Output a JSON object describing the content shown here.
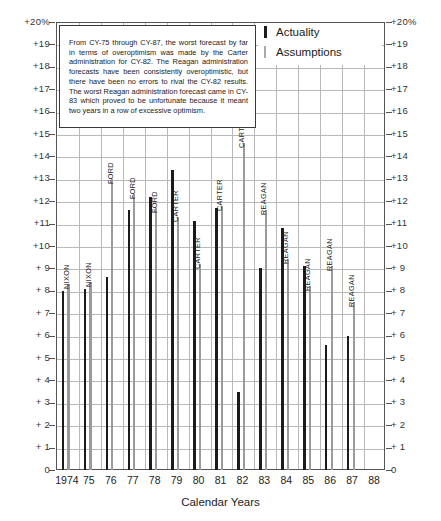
{
  "chart_data": {
    "type": "bar",
    "title": "",
    "xlabel": "Calendar Years",
    "ylabel": "",
    "ylim": [
      0,
      20
    ],
    "grid": true,
    "legend_position": "top-right",
    "categories": [
      "1974",
      "75",
      "76",
      "77",
      "78",
      "79",
      "80",
      "81",
      "82",
      "83",
      "84",
      "85",
      "86",
      "87",
      "88"
    ],
    "x_tick_labels": [
      "1974",
      "75",
      "76",
      "77",
      "78",
      "79",
      "80",
      "81",
      "82",
      "83",
      "84",
      "85",
      "86",
      "87",
      "88"
    ],
    "y_tick_labels": [
      "+20%",
      "+19",
      "+18",
      "+17",
      "+16",
      "+15",
      "+14",
      "+13",
      "+12",
      "+11",
      "+10",
      "+ 9",
      "+ 8",
      "+ 7",
      "+ 6",
      "+ 5",
      "+ 4",
      "+ 3",
      "+ 2",
      "+ 1",
      "0"
    ],
    "y_tick_values": [
      20,
      19,
      18,
      17,
      16,
      15,
      14,
      13,
      12,
      11,
      10,
      9,
      8,
      7,
      6,
      5,
      4,
      3,
      2,
      1,
      0
    ],
    "series": [
      {
        "name": "Actuality",
        "color": "#1b1b1b",
        "values": [
          8.0,
          8.1,
          8.6,
          11.6,
          12.2,
          13.4,
          11.1,
          11.7,
          3.5,
          9.0,
          10.8,
          9.1,
          5.6,
          6.0,
          null
        ]
      },
      {
        "name": "Assumptions",
        "color": "#9a9a9a",
        "values": [
          8.3,
          8.4,
          13.0,
          12.3,
          11.7,
          11.3,
          9.2,
          11.8,
          14.6,
          11.6,
          9.4,
          8.2,
          9.1,
          7.5,
          null
        ]
      }
    ],
    "bar_annotations": [
      {
        "year": "1974",
        "label": "NIXON",
        "series": "Assumptions"
      },
      {
        "year": "75",
        "label": "NIXON",
        "series": "Assumptions"
      },
      {
        "year": "76",
        "label": "FORD",
        "series": "Assumptions"
      },
      {
        "year": "77",
        "label": "FORD",
        "series": "Assumptions"
      },
      {
        "year": "78",
        "label": "FORD",
        "series": "Assumptions"
      },
      {
        "year": "79",
        "label": "CARTER",
        "series": "Assumptions"
      },
      {
        "year": "80",
        "label": "CARTER",
        "series": "Assumptions"
      },
      {
        "year": "81",
        "label": "CARTER",
        "series": "Assumptions"
      },
      {
        "year": "82",
        "label": "CARTER",
        "series": "Assumptions"
      },
      {
        "year": "83",
        "label": "REAGAN",
        "series": "Assumptions"
      },
      {
        "year": "84",
        "label": "REAGAN",
        "series": "Assumptions"
      },
      {
        "year": "85",
        "label": "REAGAN",
        "series": "Assumptions"
      },
      {
        "year": "86",
        "label": "REAGAN",
        "series": "Assumptions"
      },
      {
        "year": "87",
        "label": "REAGAN",
        "series": "Assumptions"
      },
      {
        "year": "88",
        "label": "REAGAN",
        "series": "Assumptions"
      }
    ]
  },
  "legend": {
    "items": [
      {
        "label": "Actuality",
        "color": "#1b1b1b",
        "swatch": "actual"
      },
      {
        "label": "Assumptions",
        "color": "#9a9a9a",
        "swatch": "assume"
      }
    ]
  },
  "annotation": {
    "text": "From CY-75 through CY-87, the worst forecast by far in terms of overoptimism was made by the Carter administration for CY-82. The Reagan administration forecasts have been consistently overoptimistic, but there have been no errors to rival the CY-82 results. The worst Reagan administration forecast came in CY-83 which proved to be unfortunate because it meant two years in a row of excessive optimism."
  },
  "axis": {
    "x_title": "Calendar Years"
  },
  "colors": {
    "actuality": "#1b1b1b",
    "assumptions": "#9a9a9a",
    "grid": "#b8b8b8",
    "frame": "#555555"
  }
}
